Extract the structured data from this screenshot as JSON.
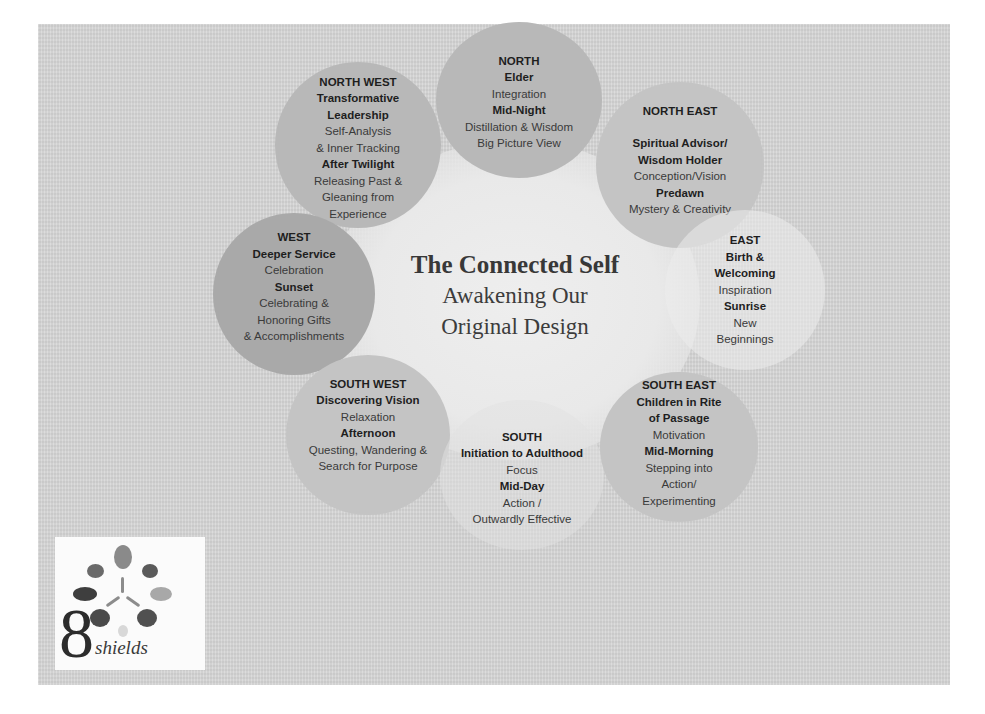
{
  "title": {
    "main": "The Connected Self",
    "subtitle_line1": "Awakening Our",
    "subtitle_line2": "Original Design"
  },
  "directions": {
    "north": {
      "heading": "NORTH",
      "role": "Elder",
      "quality": "Integration",
      "time": "Mid-Night",
      "desc_line1": "Distillation & Wisdom",
      "desc_line2": "Big Picture View"
    },
    "north_east": {
      "heading": "NORTH EAST",
      "role_line1": "Spiritual Advisor/",
      "role_line2": "Wisdom Holder",
      "quality": "Conception/Vision",
      "time": "Predawn",
      "desc_line1": "Mystery & Creativity"
    },
    "east": {
      "heading": "EAST",
      "role_line1": "Birth &",
      "role_line2": "Welcoming",
      "quality": "Inspiration",
      "time": "Sunrise",
      "desc_line1": "New",
      "desc_line2": "Beginnings"
    },
    "south_east": {
      "heading": "SOUTH EAST",
      "role_line1": "Children in Rite",
      "role_line2": "of Passage",
      "quality": "Motivation",
      "time": "Mid-Morning",
      "desc_line1": "Stepping into",
      "desc_line2": "Action/",
      "desc_line3": "Experimenting"
    },
    "south": {
      "heading": "SOUTH",
      "role": "Initiation to Adulthood",
      "quality": "Focus",
      "time": "Mid-Day",
      "desc_line1": "Action /",
      "desc_line2": "Outwardly Effective"
    },
    "south_west": {
      "heading": "SOUTH WEST",
      "role": "Discovering Vision",
      "quality": "Relaxation",
      "time": "Afternoon",
      "desc_line1": "Questing, Wandering &",
      "desc_line2": "Search for Purpose"
    },
    "west": {
      "heading": "WEST",
      "role": "Deeper Service",
      "quality": "Celebration",
      "time": "Sunset",
      "desc_line1": "Celebrating &",
      "desc_line2": "Honoring Gifts",
      "desc_line3": "& Accomplishments"
    },
    "north_west": {
      "heading": "NORTH WEST",
      "role_line1": "Transformative",
      "role_line2": "Leadership",
      "quality_line1": "Self-Analysis",
      "quality_line2": "& Inner Tracking",
      "time": "After Twilight",
      "desc_line1": "Releasing Past &",
      "desc_line2": "Gleaning from",
      "desc_line3": "Experience"
    }
  },
  "logo": {
    "numeral": "8",
    "word": "shields",
    "pebble_colors": [
      "#8a8a8a",
      "#6a6a6a",
      "#5a5a5a",
      "#3e3e3e",
      "#a8a8a8",
      "#4a4a4a",
      "#505050",
      "#d8d8d8"
    ]
  },
  "colors": {
    "panel_bg": "#d6d6d6",
    "circle_dark": "#a9a9a9",
    "circle_mid": "#b8b8b8",
    "circle_light": "#c4c4c4",
    "center_bg": "#eeeeee",
    "text": "#2a2a2a"
  }
}
